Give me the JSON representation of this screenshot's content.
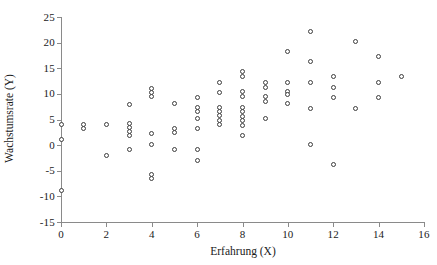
{
  "chart_data": {
    "type": "scatter",
    "title": "",
    "xlabel": "Erfahrung (X)",
    "ylabel": "Wachstumsrate (Y)",
    "xlim": [
      0,
      16
    ],
    "ylim": [
      -15,
      25
    ],
    "xticks": [
      0,
      2,
      4,
      6,
      8,
      10,
      12,
      14,
      16
    ],
    "yticks": [
      -15,
      -10,
      -5,
      0,
      5,
      10,
      15,
      20,
      25
    ],
    "xtick_labels": [
      "0",
      "2",
      "4",
      "6",
      "8",
      "10",
      "12",
      "14",
      "16"
    ],
    "ytick_labels": [
      "-15",
      "-10",
      "-5",
      "0",
      "5",
      "10",
      "15",
      "20",
      "25"
    ],
    "grid": false,
    "legend": "none",
    "marker": "open-circle",
    "marker_color": "#3d3d3d",
    "marker_fill": "#ffffff",
    "points": [
      [
        0,
        4.0
      ],
      [
        0,
        1.1
      ],
      [
        0,
        -8.9
      ],
      [
        1,
        4.0
      ],
      [
        1,
        3.2
      ],
      [
        2,
        4.1
      ],
      [
        2,
        -2.1
      ],
      [
        3,
        8.0
      ],
      [
        3,
        4.2
      ],
      [
        3,
        3.4
      ],
      [
        3,
        2.6
      ],
      [
        3,
        1.8
      ],
      [
        3,
        -0.9
      ],
      [
        4,
        11.0
      ],
      [
        4,
        10.2
      ],
      [
        4,
        9.4
      ],
      [
        4,
        2.2
      ],
      [
        4,
        0.1
      ],
      [
        4,
        -5.8
      ],
      [
        4,
        -6.6
      ],
      [
        5,
        8.1
      ],
      [
        5,
        3.2
      ],
      [
        5,
        2.4
      ],
      [
        5,
        -0.9
      ],
      [
        6,
        9.2
      ],
      [
        6,
        7.4
      ],
      [
        6,
        6.6
      ],
      [
        6,
        5.1
      ],
      [
        6,
        3.3
      ],
      [
        6,
        -0.9
      ],
      [
        6,
        -3.0
      ],
      [
        7,
        12.2
      ],
      [
        7,
        10.2
      ],
      [
        7,
        7.3
      ],
      [
        7,
        6.5
      ],
      [
        7,
        5.7
      ],
      [
        7,
        4.9
      ],
      [
        7,
        4.1
      ],
      [
        8,
        14.4
      ],
      [
        8,
        13.4
      ],
      [
        8,
        10.5
      ],
      [
        8,
        9.4
      ],
      [
        8,
        7.3
      ],
      [
        8,
        6.5
      ],
      [
        8,
        5.6
      ],
      [
        8,
        4.8
      ],
      [
        8,
        3.9
      ],
      [
        8,
        1.8
      ],
      [
        9,
        12.2
      ],
      [
        9,
        11.3
      ],
      [
        9,
        9.4
      ],
      [
        9,
        8.5
      ],
      [
        9,
        5.2
      ],
      [
        10,
        18.3
      ],
      [
        10,
        12.2
      ],
      [
        10,
        10.5
      ],
      [
        10,
        9.8
      ],
      [
        10,
        8.2
      ],
      [
        11,
        22.2
      ],
      [
        11,
        16.3
      ],
      [
        11,
        12.3
      ],
      [
        11,
        7.2
      ],
      [
        11,
        0.1
      ],
      [
        12,
        13.3
      ],
      [
        12,
        11.2
      ],
      [
        12,
        9.3
      ],
      [
        12,
        -3.8
      ],
      [
        13,
        20.2
      ],
      [
        13,
        7.2
      ],
      [
        14,
        17.3
      ],
      [
        14,
        12.3
      ],
      [
        14,
        9.2
      ],
      [
        15,
        13.3
      ]
    ]
  }
}
